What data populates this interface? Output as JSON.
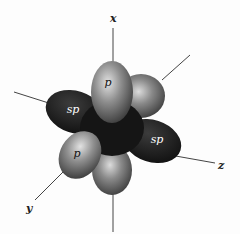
{
  "figure": {
    "axes": {
      "x": "x",
      "y": "y",
      "z": "z"
    },
    "lobes": [
      {
        "id": "p-top",
        "label": "p",
        "type": "p"
      },
      {
        "id": "p-back",
        "label": "",
        "type": "p"
      },
      {
        "id": "sp-left",
        "label": "sp",
        "type": "sp"
      },
      {
        "id": "sp-right",
        "label": "sp",
        "type": "sp"
      },
      {
        "id": "p-front-left",
        "label": "p",
        "type": "p"
      },
      {
        "id": "p-bottom",
        "label": "",
        "type": "p"
      }
    ],
    "colors": {
      "background": "#fdfdfd",
      "p_lobe": "#8a8a8a",
      "p_lobe_highlight": "#d8d8d8",
      "sp_lobe": "#1e1e1e",
      "axis_line": "#444444"
    }
  }
}
